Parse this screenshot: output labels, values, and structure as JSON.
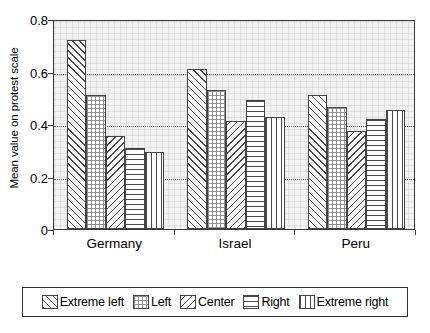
{
  "chart_data": {
    "type": "bar",
    "title": "",
    "subtitle": "",
    "xlabel": "",
    "ylabel": "Mean value on protest scale",
    "categories": [
      "Germany",
      "Israel",
      "Peru"
    ],
    "series": [
      {
        "name": "Extreme left",
        "pattern": "forward-diagonal-hatch",
        "values": [
          0.72,
          0.61,
          0.51
        ]
      },
      {
        "name": "Left",
        "pattern": "fine-grid-dotted",
        "values": [
          0.51,
          0.53,
          0.465
        ]
      },
      {
        "name": "Center",
        "pattern": "backward-diagonal-hatch",
        "values": [
          0.355,
          0.41,
          0.375
        ]
      },
      {
        "name": "Right",
        "pattern": "horizontal-lines",
        "values": [
          0.31,
          0.49,
          0.42
        ]
      },
      {
        "name": "Extreme right",
        "pattern": "vertical-lines",
        "values": [
          0.295,
          0.425,
          0.455
        ]
      }
    ],
    "ylim": [
      0,
      0.8
    ],
    "ytick_labels": [
      "0",
      "0.2",
      "0.4",
      "0.6",
      "0.8"
    ],
    "ytick_values": [
      0,
      0.2,
      0.4,
      0.6,
      0.8
    ],
    "grid": "horizontal-dotted",
    "gridline_values": [
      0.2,
      0.4,
      0.6
    ],
    "legend_position": "bottom",
    "plot_background_color": "#f2f2f2",
    "frame_color": "#3a3a3a"
  },
  "legend": {
    "entries": [
      {
        "label": "Extreme left"
      },
      {
        "label": "Left"
      },
      {
        "label": "Center"
      },
      {
        "label": "Right"
      },
      {
        "label": "Extreme right"
      }
    ]
  }
}
